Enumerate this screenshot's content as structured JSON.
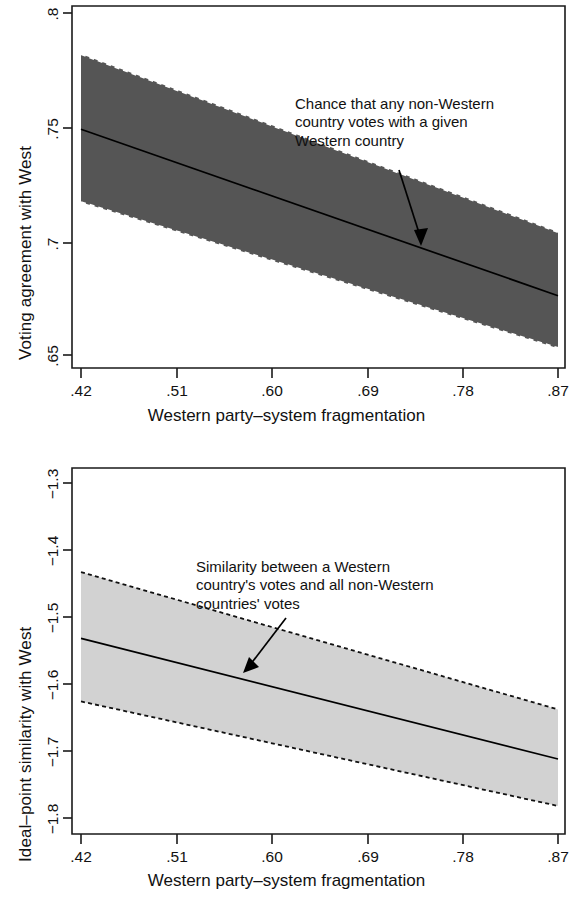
{
  "figure": {
    "background_color": "#ffffff",
    "panels": [
      {
        "id": "top",
        "annotation": "Chance that any non-Western\ncountry votes with a given\nWestern country",
        "band_color": "#555555",
        "line_color": "#000000"
      },
      {
        "id": "bottom",
        "annotation": "Similarity between a Western\ncountry's votes and all non-Western\ncountries' votes",
        "band_color": "#d2d2d2",
        "line_color": "#000000"
      }
    ]
  },
  "chart_data": [
    {
      "type": "line",
      "title": "",
      "subtitle": "",
      "xlabel": "Western party–system fragmentation",
      "ylabel": "Voting agreement with West",
      "xlim": [
        0.42,
        0.87
      ],
      "ylim": [
        0.65,
        0.8
      ],
      "xticks": [
        0.42,
        0.51,
        0.6,
        0.69,
        0.78,
        0.87
      ],
      "xtick_labels": [
        ".42",
        ".51",
        ".60",
        ".69",
        ".78",
        ".87"
      ],
      "yticks": [
        0.8,
        0.75,
        0.7,
        0.65
      ],
      "ytick_labels": [
        ".8",
        ".75",
        ".7",
        ".65"
      ],
      "grid": false,
      "legend": "none",
      "annotations": [
        {
          "text": "Chance that any non-Western country votes with a given Western country",
          "arrow_from": [
            0.72,
            0.7715
          ],
          "arrow_to": [
            0.745,
            0.7
          ],
          "band_style": "dashed"
        }
      ],
      "series": [
        {
          "name": "Predicted voting agreement",
          "style": "solid",
          "x": [
            0.42,
            0.87
          ],
          "values": [
            0.749,
            0.676
          ]
        },
        {
          "name": "95% confidence interval upper bound",
          "style": "dashed",
          "x": [
            0.42,
            0.87
          ],
          "values": [
            0.782,
            0.704
          ]
        },
        {
          "name": "95% confidence interval lower bound",
          "style": "dashed",
          "x": [
            0.42,
            0.87
          ],
          "values": [
            0.717,
            0.653
          ]
        }
      ]
    },
    {
      "type": "line",
      "title": "",
      "subtitle": "",
      "xlabel": "Western party–system fragmentation",
      "ylabel": "Ideal–point similarity with West",
      "xlim": [
        0.42,
        0.87
      ],
      "ylim": [
        -1.8,
        -1.3
      ],
      "xticks": [
        0.42,
        0.51,
        0.6,
        0.69,
        0.78,
        0.87
      ],
      "xtick_labels": [
        ".42",
        ".51",
        ".60",
        ".69",
        ".78",
        ".87"
      ],
      "yticks": [
        -1.3,
        -1.4,
        -1.5,
        -1.6,
        -1.7,
        -1.8
      ],
      "ytick_labels": [
        "−1.3",
        "−1.4",
        "−1.5",
        "−1.6",
        "−1.7",
        "−1.8"
      ],
      "grid": false,
      "legend": "none",
      "annotations": [
        {
          "text": "Similarity between a Western country's votes and all non-Western countries' votes",
          "arrow_from": [
            0.6265,
            -1.5255
          ],
          "arrow_to": [
            0.6075,
            -1.604
          ],
          "band_style": "dotted"
        }
      ],
      "series": [
        {
          "name": "Predicted ideal-point similarity",
          "style": "solid",
          "x": [
            0.42,
            0.87
          ],
          "values": [
            -1.532,
            -1.712
          ]
        },
        {
          "name": "95% confidence interval upper bound",
          "style": "dotted",
          "x": [
            0.42,
            0.87
          ],
          "values": [
            -1.433,
            -1.638
          ]
        },
        {
          "name": "95% confidence interval lower bound",
          "style": "dotted",
          "x": [
            0.42,
            0.87
          ],
          "values": [
            -1.626,
            -1.782
          ]
        }
      ]
    }
  ]
}
